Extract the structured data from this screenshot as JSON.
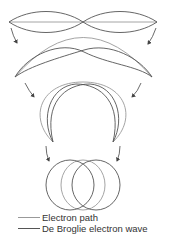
{
  "diagram": {
    "stages": [
      {
        "id": 1,
        "shape": "flat-line",
        "description": "Straight electron path with standing wave (two half-wavelengths)"
      },
      {
        "id": 2,
        "shape": "shallow-arc",
        "description": "Electron path bent into arc, wave follows"
      },
      {
        "id": 3,
        "shape": "horseshoe",
        "description": "Path bent into near-circle, wave follows"
      },
      {
        "id": 4,
        "shape": "closed-circle",
        "description": "Closed circular orbit with fitting de Broglie wave"
      }
    ],
    "arrows": 6,
    "colors": {
      "electron_path": "#9a9a9a",
      "de_broglie_wave": "#555555",
      "arrow": "#444444"
    }
  },
  "legend": {
    "items": [
      {
        "label": "Electron path",
        "color": "#9a9a9a"
      },
      {
        "label": "De Broglie electron wave",
        "color": "#555555"
      }
    ]
  }
}
